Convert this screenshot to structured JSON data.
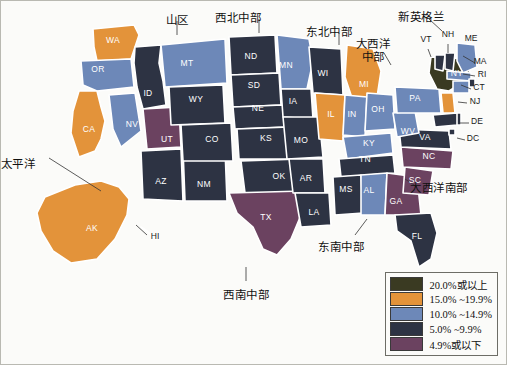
{
  "figure": {
    "title": "",
    "background_color": "#fbfbf9",
    "frame_color": "#b9b9b2"
  },
  "chart_data": {
    "type": "heatmap",
    "title": "",
    "subtitle": "",
    "xlabel": "",
    "ylabel": "",
    "map_kind": "choropleth-us-states",
    "legend_position": "bottom-right",
    "grid": false,
    "bins": [
      {
        "label": "20.0%或以上",
        "color": "#3a3a22",
        "min": 20.0,
        "max": null
      },
      {
        "label": "15.0% ~19.9%",
        "color": "#e3933a",
        "min": 15.0,
        "max": 19.9
      },
      {
        "label": "10.0% ~14.9%",
        "color": "#6d88b8",
        "min": 10.0,
        "max": 14.9
      },
      {
        "label": "5.0% ~9.9%",
        "color": "#2d3343",
        "min": 5.0,
        "max": 9.9
      },
      {
        "label": "4.9%或以下",
        "color": "#6b4260",
        "min": null,
        "max": 4.9
      }
    ],
    "categories": [
      "AK",
      "AL",
      "AR",
      "AZ",
      "CA",
      "CO",
      "CT",
      "DC",
      "DE",
      "FL",
      "GA",
      "HI",
      "IA",
      "ID",
      "IL",
      "IN",
      "KS",
      "KY",
      "LA",
      "MA",
      "MD",
      "ME",
      "MI",
      "MN",
      "MO",
      "MS",
      "MT",
      "NC",
      "ND",
      "NE",
      "NH",
      "NJ",
      "NM",
      "NV",
      "NY",
      "OH",
      "OK",
      "OR",
      "PA",
      "RI",
      "SC",
      "SD",
      "TN",
      "TX",
      "UT",
      "VA",
      "VT",
      "WA",
      "WI",
      "WV",
      "WY"
    ],
    "values": [
      {
        "code": "AK",
        "bin": 1
      },
      {
        "code": "AL",
        "bin": 2
      },
      {
        "code": "AR",
        "bin": 3
      },
      {
        "code": "AZ",
        "bin": 3
      },
      {
        "code": "CA",
        "bin": 1
      },
      {
        "code": "CO",
        "bin": 3
      },
      {
        "code": "CT",
        "bin": 2
      },
      {
        "code": "DC",
        "bin": 3
      },
      {
        "code": "DE",
        "bin": 3
      },
      {
        "code": "FL",
        "bin": 3
      },
      {
        "code": "GA",
        "bin": 4
      },
      {
        "code": "HI",
        "bin": 3
      },
      {
        "code": "IA",
        "bin": 3
      },
      {
        "code": "ID",
        "bin": 3
      },
      {
        "code": "IL",
        "bin": 1
      },
      {
        "code": "IN",
        "bin": 2
      },
      {
        "code": "KS",
        "bin": 3
      },
      {
        "code": "KY",
        "bin": 2
      },
      {
        "code": "LA",
        "bin": 3
      },
      {
        "code": "MA",
        "bin": 2
      },
      {
        "code": "MD",
        "bin": 3
      },
      {
        "code": "ME",
        "bin": 2
      },
      {
        "code": "MI",
        "bin": 1
      },
      {
        "code": "MN",
        "bin": 2
      },
      {
        "code": "MO",
        "bin": 3
      },
      {
        "code": "MS",
        "bin": 3
      },
      {
        "code": "MT",
        "bin": 2
      },
      {
        "code": "NC",
        "bin": 4
      },
      {
        "code": "ND",
        "bin": 3
      },
      {
        "code": "NE",
        "bin": 3
      },
      {
        "code": "NH",
        "bin": 3
      },
      {
        "code": "NJ",
        "bin": 1
      },
      {
        "code": "NM",
        "bin": 3
      },
      {
        "code": "NV",
        "bin": 2
      },
      {
        "code": "NY",
        "bin": 0
      },
      {
        "code": "OH",
        "bin": 2
      },
      {
        "code": "OK",
        "bin": 3
      },
      {
        "code": "OR",
        "bin": 2
      },
      {
        "code": "PA",
        "bin": 2
      },
      {
        "code": "RI",
        "bin": 3
      },
      {
        "code": "SC",
        "bin": 4
      },
      {
        "code": "SD",
        "bin": 3
      },
      {
        "code": "TN",
        "bin": 3
      },
      {
        "code": "TX",
        "bin": 4
      },
      {
        "code": "UT",
        "bin": 4
      },
      {
        "code": "VA",
        "bin": 3
      },
      {
        "code": "VT",
        "bin": 3
      },
      {
        "code": "WA",
        "bin": 1
      },
      {
        "code": "WI",
        "bin": 3
      },
      {
        "code": "WV",
        "bin": 2
      },
      {
        "code": "WY",
        "bin": 3
      }
    ]
  },
  "map": {
    "inline_state_labels": [
      {
        "code": "WA",
        "x": 112,
        "y": 42
      },
      {
        "code": "OR",
        "x": 97,
        "y": 71
      },
      {
        "code": "CA",
        "x": 88,
        "y": 131
      },
      {
        "code": "ID",
        "x": 147,
        "y": 95
      },
      {
        "code": "NV",
        "x": 131,
        "y": 126
      },
      {
        "code": "UT",
        "x": 166,
        "y": 141
      },
      {
        "code": "AZ",
        "x": 160,
        "y": 183
      },
      {
        "code": "NM",
        "x": 203,
        "y": 186
      },
      {
        "code": "MT",
        "x": 186,
        "y": 65
      },
      {
        "code": "WY",
        "x": 195,
        "y": 101
      },
      {
        "code": "CO",
        "x": 211,
        "y": 141
      },
      {
        "code": "ND",
        "x": 250,
        "y": 58
      },
      {
        "code": "SD",
        "x": 253,
        "y": 87
      },
      {
        "code": "NE",
        "x": 257,
        "y": 110
      },
      {
        "code": "KS",
        "x": 265,
        "y": 140
      },
      {
        "code": "OK",
        "x": 278,
        "y": 178
      },
      {
        "code": "TX",
        "x": 265,
        "y": 219
      },
      {
        "code": "MN",
        "x": 285,
        "y": 67
      },
      {
        "code": "IA",
        "x": 292,
        "y": 103
      },
      {
        "code": "MO",
        "x": 300,
        "y": 142
      },
      {
        "code": "AR",
        "x": 305,
        "y": 180
      },
      {
        "code": "LA",
        "x": 313,
        "y": 214
      },
      {
        "code": "WI",
        "x": 322,
        "y": 75
      },
      {
        "code": "MI",
        "x": 363,
        "y": 86
      },
      {
        "code": "IL",
        "x": 330,
        "y": 116
      },
      {
        "code": "IN",
        "x": 351,
        "y": 116
      },
      {
        "code": "OH",
        "x": 377,
        "y": 111
      },
      {
        "code": "KY",
        "x": 368,
        "y": 145
      },
      {
        "code": "TN",
        "x": 364,
        "y": 161
      },
      {
        "code": "MS",
        "x": 345,
        "y": 191
      },
      {
        "code": "AL",
        "x": 368,
        "y": 192
      },
      {
        "code": "GA",
        "x": 395,
        "y": 203
      },
      {
        "code": "FL",
        "x": 416,
        "y": 238
      },
      {
        "code": "SC",
        "x": 414,
        "y": 182
      },
      {
        "code": "NC",
        "x": 428,
        "y": 158
      },
      {
        "code": "VA",
        "x": 424,
        "y": 139
      },
      {
        "code": "WV",
        "x": 407,
        "y": 133
      },
      {
        "code": "PA",
        "x": 414,
        "y": 100
      },
      {
        "code": "NY",
        "x": 456,
        "y": 75
      },
      {
        "code": "AK",
        "x": 91,
        "y": 230
      }
    ],
    "external_state_labels": [
      {
        "code": "VT",
        "x": 425,
        "y": 41
      },
      {
        "code": "NH",
        "x": 447,
        "y": 36
      },
      {
        "code": "ME",
        "x": 470,
        "y": 40
      },
      {
        "code": "MA",
        "x": 479,
        "y": 63
      },
      {
        "code": "RI",
        "x": 481,
        "y": 76
      },
      {
        "code": "CT",
        "x": 478,
        "y": 89
      },
      {
        "code": "NJ",
        "x": 474,
        "y": 103
      },
      {
        "code": "DE",
        "x": 476,
        "y": 123
      },
      {
        "code": "DC",
        "x": 472,
        "y": 140
      },
      {
        "code": "HI",
        "x": 154,
        "y": 238
      }
    ],
    "region_labels": [
      {
        "name": "mountain",
        "text": "山区",
        "x": 176,
        "y": 13
      },
      {
        "name": "west-north-central",
        "text": "西北中部",
        "x": 237,
        "y": 11
      },
      {
        "name": "east-north-central",
        "text": "东北中部",
        "x": 328,
        "y": 25
      },
      {
        "name": "mid-atlantic",
        "text": "大西洋\n中部",
        "x": 372,
        "y": 37
      },
      {
        "name": "new-england",
        "text": "新英格兰",
        "x": 420,
        "y": 10
      },
      {
        "name": "pacific",
        "text": "太平洋",
        "x": 17,
        "y": 157
      },
      {
        "name": "west-south-central",
        "text": "西南中部",
        "x": 245,
        "y": 288
      },
      {
        "name": "east-south-central",
        "text": "东南中部",
        "x": 340,
        "y": 240
      },
      {
        "name": "south-atlantic",
        "text": "大西洋南部",
        "x": 438,
        "y": 181
      }
    ]
  },
  "legend": {
    "items": [
      {
        "label": "20.0%或以上",
        "color": "#3a3a22"
      },
      {
        "label": "15.0% ~19.9%",
        "color": "#e3933a"
      },
      {
        "label": "10.0% ~14.9%",
        "color": "#6d88b8"
      },
      {
        "label": "5.0% ~9.9%",
        "color": "#2d3343"
      },
      {
        "label": "4.9%或以下",
        "color": "#6b4260"
      }
    ]
  }
}
